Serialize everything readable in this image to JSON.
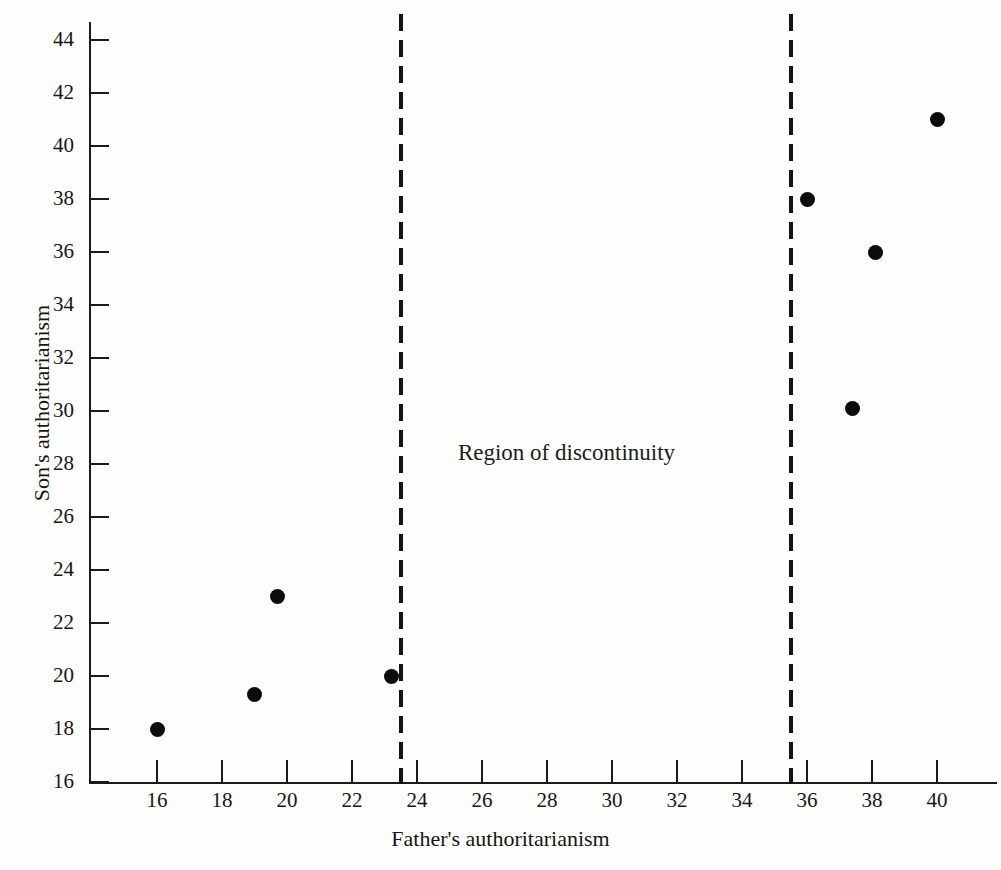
{
  "chart_data": {
    "type": "scatter",
    "title": "",
    "xlabel": "Father's authoritarianism",
    "ylabel": "Son's authoritarianism",
    "xlim": [
      15.0,
      40.9
    ],
    "ylim": [
      16,
      44.8
    ],
    "grid": false,
    "legend": null,
    "x_ticks": [
      16,
      18,
      20,
      22,
      24,
      26,
      28,
      30,
      32,
      34,
      36,
      38,
      40
    ],
    "y_ticks": [
      16,
      18,
      20,
      22,
      24,
      26,
      28,
      30,
      32,
      34,
      36,
      38,
      40,
      42,
      44
    ],
    "points": [
      {
        "x": 16.0,
        "y": 18.0
      },
      {
        "x": 19.0,
        "y": 19.3
      },
      {
        "x": 19.7,
        "y": 23.0
      },
      {
        "x": 23.2,
        "y": 20.0
      },
      {
        "x": 36.0,
        "y": 38.0
      },
      {
        "x": 37.4,
        "y": 30.1
      },
      {
        "x": 38.1,
        "y": 36.0
      },
      {
        "x": 40.0,
        "y": 41.0
      }
    ],
    "annotations": [
      {
        "text": "Region of discontinuity",
        "x": 28.6,
        "y": 28.4
      }
    ],
    "vertical_cut_lines": [
      {
        "x": 23.5,
        "style": "dashed"
      },
      {
        "x": 35.5,
        "style": "dashed"
      }
    ]
  },
  "colors": {
    "point": "#0c0c0c",
    "axis": "#1a1a1a",
    "text": "#171717",
    "background": "#fdfdfc"
  }
}
